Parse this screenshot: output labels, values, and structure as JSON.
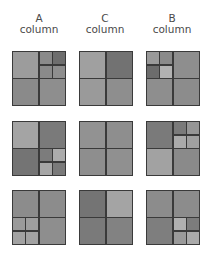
{
  "columns": [
    {
      "letter": "A",
      "word": "column"
    },
    {
      "letter": "C",
      "word": "column"
    },
    {
      "letter": "B",
      "word": "column"
    }
  ],
  "colors": {
    "border": "#3a3a3a",
    "text": "#4a4a4a",
    "light": "#a8a8a8",
    "light_mid": "#9a9a9a",
    "mid": "#8c8c8c",
    "mid_dark": "#7e7e7e",
    "dark": "#6c6c6c"
  },
  "grid": [
    [
      {
        "name": "A-row1",
        "cells": [
          "#9c9c9c",
          [
            "#8a8a8a",
            "#6e6e6e",
            "#8a8a8a",
            "#8e8e8e"
          ],
          "#8a8a8a",
          "#8e8e8e"
        ]
      },
      {
        "name": "C-row1",
        "cells": [
          "#a0a0a0",
          "#727272",
          "#9a9a9a",
          "#8e8e8e"
        ]
      },
      {
        "name": "B-row1",
        "cells": [
          [
            "#9a9a9a",
            "#8a8a8a",
            "#6c6c6c",
            "#b2b2b2"
          ],
          "#8e8e8e",
          "#8e8e8e",
          "#8c8c8c"
        ]
      }
    ],
    [
      {
        "name": "A-row2",
        "cells": [
          "#a4a4a4",
          "#7a7a7a",
          "#747474",
          [
            "#7c7c7c",
            "#acacac",
            "#a6a6a6",
            "#7a7a7a"
          ]
        ]
      },
      {
        "name": "C-row2",
        "cells": [
          "#929292",
          "#8e8e8e",
          "#8e8e8e",
          "#909090"
        ]
      },
      {
        "name": "B-row2",
        "cells": [
          "#7a7a7a",
          [
            "#7a7a7a",
            "#969696",
            "#aaaaaa",
            "#a0a0a0"
          ],
          "#a2a2a2",
          "#8a8a8a"
        ]
      }
    ],
    [
      {
        "name": "A-row3",
        "cells": [
          "#8c8c8c",
          "#8c8c8c",
          [
            "#9a9a9a",
            "#9e9e9e",
            "#a2a2a2",
            "#a2a2a2"
          ],
          "#8e8e8e"
        ]
      },
      {
        "name": "C-row3",
        "cells": [
          "#747474",
          "#a4a4a4",
          "#7a7a7a",
          "#828282"
        ]
      },
      {
        "name": "B-row3",
        "cells": [
          "#8c8c8c",
          "#8c8c8c",
          "#7e7e7e",
          [
            "#b0b0b0",
            "#7c7c7c",
            "#9a9a9a",
            "#aaaaaa"
          ]
        ]
      }
    ]
  ]
}
